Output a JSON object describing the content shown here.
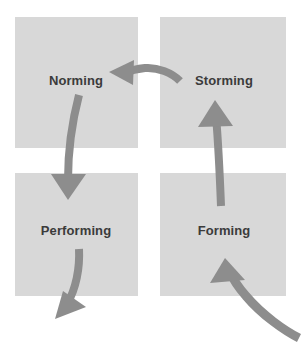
{
  "diagram": {
    "type": "cycle-diagram",
    "background_color": "#ffffff",
    "box_color": "#d8d8d8",
    "label_color": "#3b3b3b",
    "arrow_color": "#8d8d8d",
    "stages": [
      {
        "id": "norming",
        "label": "Norming",
        "position": "top-left",
        "box": {
          "x": 15,
          "y": 17,
          "width": 123,
          "height": 131
        },
        "label_center": {
          "x": 76,
          "y": 80
        }
      },
      {
        "id": "storming",
        "label": "Storming",
        "position": "top-right",
        "box": {
          "x": 160,
          "y": 17,
          "width": 126,
          "height": 131
        },
        "label_center": {
          "x": 224,
          "y": 80
        }
      },
      {
        "id": "performing",
        "label": "Performing",
        "position": "bottom-left",
        "box": {
          "x": 15,
          "y": 173,
          "width": 123,
          "height": 123
        },
        "label_center": {
          "x": 76,
          "y": 230
        }
      },
      {
        "id": "forming",
        "label": "Forming",
        "position": "bottom-right",
        "box": {
          "x": 160,
          "y": 173,
          "width": 126,
          "height": 123
        },
        "label_center": {
          "x": 224,
          "y": 230
        }
      }
    ],
    "arrows": [
      {
        "id": "arrow-entry-to-forming",
        "name": "entry-arrow-to-forming",
        "from": "external-bottom-right",
        "to": "forming",
        "direction": "up-left"
      },
      {
        "id": "arrow-forming-to-storming",
        "name": "arrow-forming-to-storming",
        "from": "forming",
        "to": "storming",
        "direction": "up"
      },
      {
        "id": "arrow-storming-to-norming",
        "name": "arrow-storming-to-norming",
        "from": "storming",
        "to": "norming",
        "direction": "left"
      },
      {
        "id": "arrow-norming-to-performing",
        "name": "arrow-norming-to-performing",
        "from": "norming",
        "to": "performing",
        "direction": "down"
      },
      {
        "id": "arrow-performing-exit",
        "name": "exit-arrow-from-performing",
        "from": "performing",
        "to": "external-bottom-left",
        "direction": "down-left"
      }
    ]
  }
}
